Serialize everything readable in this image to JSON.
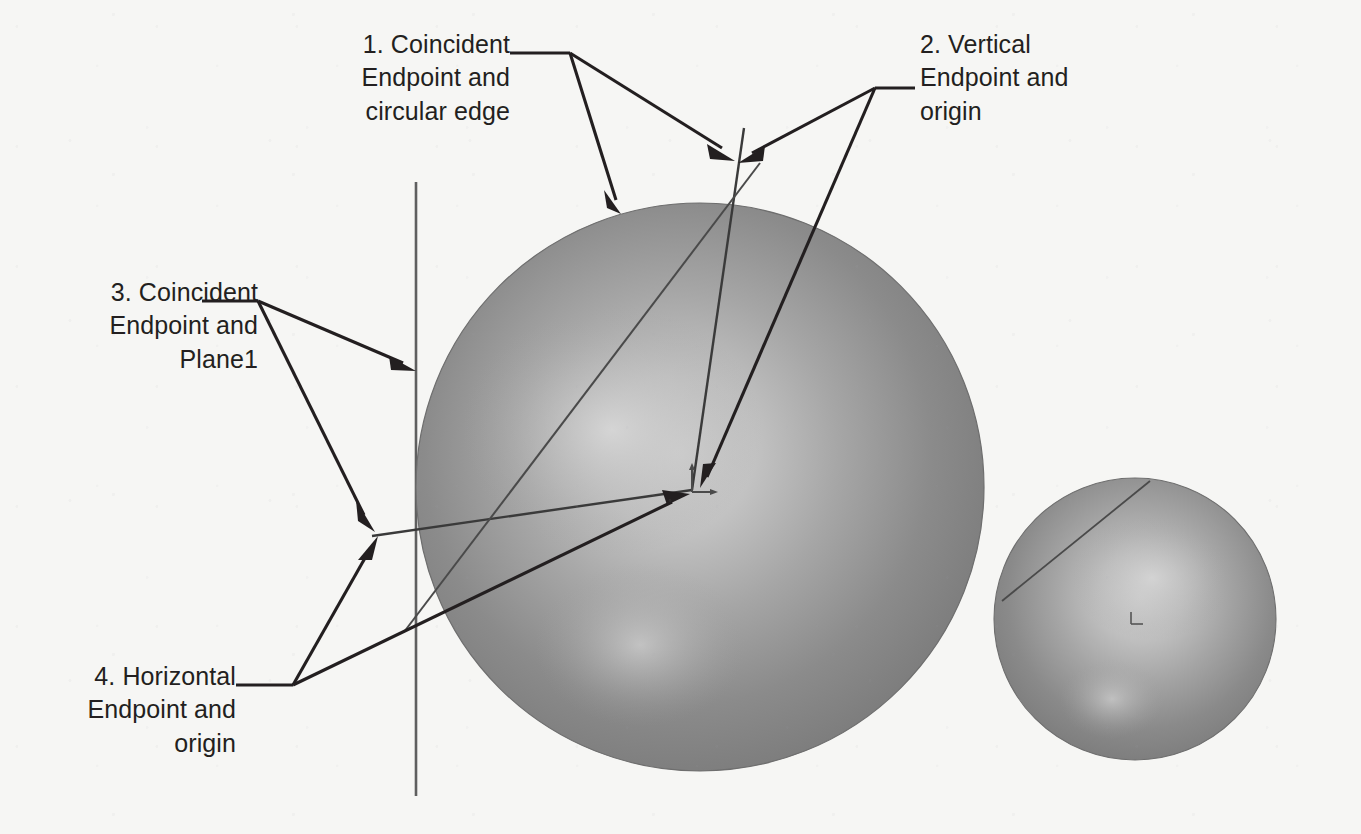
{
  "diagram": {
    "background_color": "#f6f6f4",
    "ink_color": "#231f20",
    "sphere_color": "#8d8d8d",
    "annotations": [
      {
        "id": "annotation-1",
        "number": "1.",
        "relation": "Coincident",
        "line1": "1. Coincident",
        "line2": "Endpoint and",
        "line3": "circular edge",
        "text": "1. Coincident\nEndpoint and\ncircular edge",
        "align": "right",
        "targets": [
          "top-circular-edge",
          "line-top-endpoint"
        ]
      },
      {
        "id": "annotation-2",
        "number": "2.",
        "relation": "Vertical",
        "line1": "2. Vertical",
        "line2": "Endpoint and",
        "line3": "origin",
        "text": "2. Vertical\nEndpoint and\norigin",
        "align": "left",
        "targets": [
          "line-top-endpoint",
          "sphere-origin"
        ]
      },
      {
        "id": "annotation-3",
        "number": "3.",
        "relation": "Coincident",
        "line1": "3. Coincident",
        "line2": "Endpoint and",
        "line3": "Plane1",
        "text": "3. Coincident\nEndpoint and\nPlane1",
        "align": "right",
        "targets": [
          "plane1-line",
          "line-left-endpoint"
        ]
      },
      {
        "id": "annotation-4",
        "number": "4.",
        "relation": "Horizontal",
        "line1": "4. Horizontal",
        "line2": "Endpoint and",
        "line3": "origin",
        "text": "4. Horizontal\nEndpoint and\norigin",
        "align": "right",
        "targets": [
          "line-left-endpoint",
          "sphere-origin"
        ]
      }
    ],
    "geometry": {
      "large_sphere": {
        "cx": 700,
        "cy": 487,
        "r": 284
      },
      "small_sphere": {
        "cx": 1135,
        "cy": 619,
        "r": 141
      },
      "plane1_line": {
        "x": 416,
        "y1": 182,
        "y2": 796
      },
      "origin_marker": {
        "x": 692,
        "y": 490
      },
      "small_origin_marker": {
        "x": 1137,
        "y": 617
      },
      "vertical_sketch_line": {
        "x1": 735,
        "y1": 163,
        "x2": 692,
        "y2": 490
      },
      "horizontal_sketch_line": {
        "x1": 375,
        "y1": 533,
        "x2": 692,
        "y2": 490
      }
    }
  }
}
